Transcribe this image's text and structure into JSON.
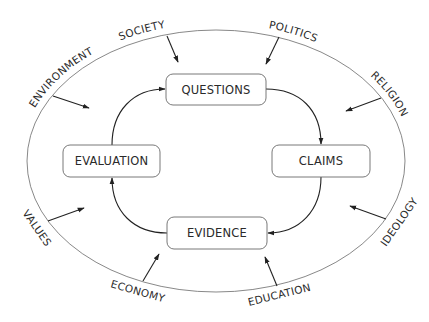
{
  "diagram": {
    "type": "cycle-with-external-influences",
    "cycle_nodes": [
      {
        "id": "questions",
        "label": "QUESTIONS"
      },
      {
        "id": "claims",
        "label": "CLAIMS"
      },
      {
        "id": "evidence",
        "label": "EVIDENCE"
      },
      {
        "id": "evaluation",
        "label": "EVALUATION"
      }
    ],
    "cycle_edges": [
      {
        "from": "questions",
        "to": "claims"
      },
      {
        "from": "claims",
        "to": "evidence"
      },
      {
        "from": "evidence",
        "to": "evaluation"
      },
      {
        "from": "evaluation",
        "to": "questions"
      }
    ],
    "influences": [
      {
        "id": "society",
        "label": "SOCIETY"
      },
      {
        "id": "politics",
        "label": "POLITICS"
      },
      {
        "id": "religion",
        "label": "RELIGION"
      },
      {
        "id": "ideology",
        "label": "IDEOLOGY"
      },
      {
        "id": "education",
        "label": "EDUCATION"
      },
      {
        "id": "economy",
        "label": "ECONOMY"
      },
      {
        "id": "values",
        "label": "VALUES"
      },
      {
        "id": "environment",
        "label": "ENVIRONMENT"
      }
    ],
    "colors": {
      "stroke": "#222222",
      "box_border": "#6a6a6a",
      "text": "#2a2a2a",
      "background": "#ffffff"
    }
  }
}
